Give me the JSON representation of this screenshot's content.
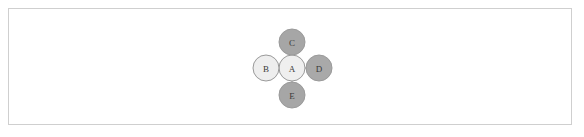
{
  "figure": {
    "title": "",
    "background_color": "#ffffff",
    "border_color": "#cfcfcf"
  },
  "diagram": {
    "type": "node-link-graph",
    "layout": "star",
    "node_radius": 13,
    "edge_color": "#9a9a9a",
    "edge_width": 1,
    "node_stroke_color": "#9a9a9a",
    "node_stroke_width": 1,
    "label_color": "#3a3a3a",
    "nodes": [
      {
        "id": "A",
        "label": "A",
        "cx": 292,
        "cy": 68,
        "fill": "#efefef",
        "role": "center"
      },
      {
        "id": "B",
        "label": "B",
        "cx": 266,
        "cy": 68,
        "fill": "#eeeeee",
        "role": "leaf"
      },
      {
        "id": "C",
        "label": "C",
        "cx": 292,
        "cy": 42,
        "fill": "#a6a6a6",
        "role": "leaf"
      },
      {
        "id": "D",
        "label": "D",
        "cx": 319,
        "cy": 68,
        "fill": "#a9a9a9",
        "role": "leaf"
      },
      {
        "id": "E",
        "label": "E",
        "cx": 292,
        "cy": 95,
        "fill": "#a6a6a6",
        "role": "leaf"
      }
    ],
    "edges": [
      {
        "id": "A-B",
        "source": "A",
        "target": "B"
      },
      {
        "id": "A-C",
        "source": "A",
        "target": "C"
      },
      {
        "id": "A-D",
        "source": "A",
        "target": "D"
      },
      {
        "id": "A-E",
        "source": "A",
        "target": "E"
      }
    ]
  }
}
